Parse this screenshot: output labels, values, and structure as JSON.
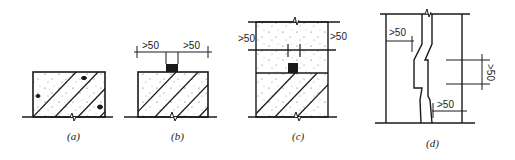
{
  "diagram": {
    "panels": [
      {
        "id": "a",
        "label": "(a)"
      },
      {
        "id": "b",
        "label": "(b)",
        "dimensions": [
          ">50",
          ">50"
        ]
      },
      {
        "id": "c",
        "label": "(c)",
        "dimensions": [
          ">50",
          ">50"
        ]
      },
      {
        "id": "d",
        "label": "(d)",
        "dimensions": [
          ">50",
          ">50",
          ">50"
        ]
      }
    ],
    "colors": {
      "line": "#1a1a1a",
      "fill": "#ffffff",
      "speckle": "#555555"
    }
  }
}
